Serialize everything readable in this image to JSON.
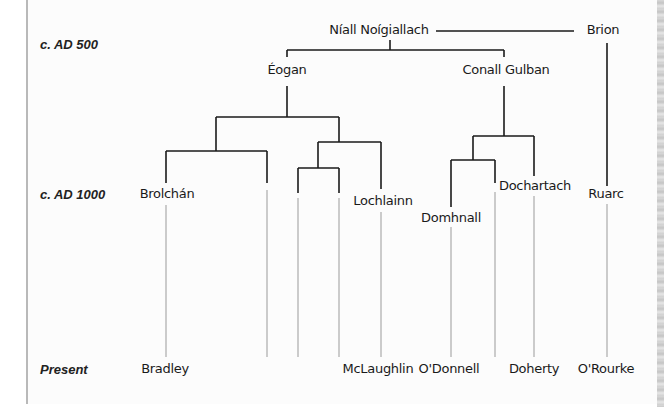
{
  "eras": [
    {
      "label": "c. AD 500",
      "x": 40,
      "y": 37
    },
    {
      "label": "c. AD 1000",
      "x": 40,
      "y": 187
    },
    {
      "label": "Present",
      "x": 40,
      "y": 362
    }
  ],
  "people": {
    "niall": {
      "label": "Níall Noígiallach",
      "x": 379,
      "y": 22
    },
    "brion": {
      "label": "Brion",
      "x": 603,
      "y": 22
    },
    "eogan": {
      "label": "Éogan",
      "x": 287,
      "y": 62
    },
    "conall": {
      "label": "Conall Gulban",
      "x": 506,
      "y": 62
    },
    "brolchan": {
      "label": "Brolchán",
      "x": 167,
      "y": 186
    },
    "lochlainn": {
      "label": "Lochlainn",
      "x": 383,
      "y": 193
    },
    "dochartach": {
      "label": "Dochartach",
      "x": 535,
      "y": 178
    },
    "domhnall": {
      "label": "Domhnall",
      "x": 451,
      "y": 210
    },
    "ruarc": {
      "label": "Ruarc",
      "x": 606,
      "y": 186
    }
  },
  "surnames": [
    {
      "label": "Bradley",
      "x": 165,
      "y": 361
    },
    {
      "label": "McLaughlin",
      "x": 378,
      "y": 361
    },
    {
      "label": "O'Donnell",
      "x": 449,
      "y": 361
    },
    {
      "label": "Doherty",
      "x": 534,
      "y": 361
    },
    {
      "label": "O'Rourke",
      "x": 606,
      "y": 361
    }
  ],
  "colors": {
    "dark_line": "#1a1a1a",
    "light_line": "#9a9a9a",
    "text": "#1a1a1a"
  }
}
